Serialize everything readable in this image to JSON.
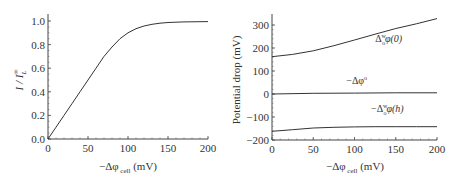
{
  "chart_data": [
    {
      "type": "line",
      "title": "",
      "xlabel": "−Δφ cell (mV)",
      "ylabel": "I / I_L^∞",
      "xlim": [
        0,
        200
      ],
      "ylim": [
        0,
        1.05
      ],
      "xticks": [
        0,
        50,
        100,
        150,
        200
      ],
      "xtick_labels": [
        "0",
        "50",
        "100",
        "150",
        "200"
      ],
      "yticks": [
        0,
        0.2,
        0.4,
        0.6,
        0.8,
        1.0
      ],
      "ytick_labels": [
        "0.0",
        "0.2",
        "0.4",
        "0.6",
        "0.8",
        "1.0"
      ],
      "grid": false,
      "series": [
        {
          "name": "I/I_L",
          "x": [
            0,
            10,
            20,
            30,
            40,
            50,
            60,
            70,
            80,
            90,
            100,
            110,
            120,
            130,
            140,
            150,
            160,
            170,
            180,
            190,
            200
          ],
          "y": [
            0,
            0.1,
            0.2,
            0.3,
            0.4,
            0.5,
            0.6,
            0.7,
            0.78,
            0.85,
            0.9,
            0.935,
            0.958,
            0.972,
            0.981,
            0.987,
            0.99,
            0.992,
            0.993,
            0.994,
            0.995
          ]
        }
      ]
    },
    {
      "type": "line",
      "title": "",
      "xlabel": "−Δφ cell (mV)",
      "ylabel": "Potential drop (mV)",
      "xlim": [
        0,
        200
      ],
      "ylim": [
        -200,
        340
      ],
      "xticks": [
        0,
        50,
        100,
        150,
        200
      ],
      "xtick_labels": [
        "0",
        "50",
        "100",
        "150",
        "200"
      ],
      "yticks": [
        -200,
        -100,
        0,
        100,
        200,
        300
      ],
      "ytick_labels": [
        "−200",
        "−100",
        "0",
        "100",
        "200",
        "300"
      ],
      "grid": false,
      "series": [
        {
          "name": "Δ_o^w φ(0)",
          "x": [
            0,
            25,
            50,
            75,
            100,
            125,
            150,
            175,
            200
          ],
          "y": [
            162,
            172,
            188,
            210,
            235,
            260,
            285,
            305,
            328
          ]
        },
        {
          "name": "−Δφ°",
          "x": [
            0,
            50,
            100,
            150,
            200
          ],
          "y": [
            0,
            3,
            4,
            5,
            5
          ]
        },
        {
          "name": "−Δ_o^w φ(h)",
          "x": [
            0,
            25,
            50,
            75,
            100,
            125,
            150,
            175,
            200
          ],
          "y": [
            -162,
            -155,
            -148,
            -145,
            -143,
            -142,
            -142,
            -142,
            -142
          ]
        }
      ],
      "annotations": [
        {
          "text": "Δ",
          "sub": "o",
          "sup": "w",
          "tail": "φ(0)",
          "x": 125,
          "y": 225
        },
        {
          "text": "−Δφ",
          "sup": "o",
          "x": 90,
          "y": 45
        },
        {
          "text": "−Δ",
          "sub": "o",
          "sup": "w",
          "tail": "φ(h)",
          "x": 120,
          "y": -80
        }
      ]
    }
  ],
  "labels": {
    "left_ylabel_main": "I / I",
    "left_ylabel_sub": "L",
    "left_ylabel_sup": "∞",
    "xlabel_main": "−Δφ",
    "xlabel_sub": "cell",
    "xlabel_unit": "(mV)",
    "right_ylabel": "Potential drop (mV)"
  }
}
